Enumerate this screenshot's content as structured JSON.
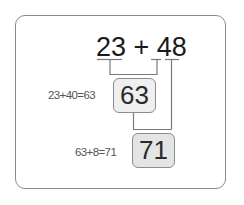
{
  "expression": {
    "text": "23 + 48",
    "left_operand": "23",
    "operator": "+",
    "right_operand": "48",
    "right_operand_tens": "4",
    "right_operand_ones": "8"
  },
  "steps": [
    {
      "equation": "23+40=63",
      "result": "63"
    },
    {
      "equation": "63+8=71",
      "result": "71"
    }
  ],
  "colors": {
    "border": "#8a8a8a",
    "line": "#7a7a7a",
    "box1_fill": "#efefef",
    "box2_fill": "#e4e4e4",
    "text": "#1a1a1a"
  }
}
